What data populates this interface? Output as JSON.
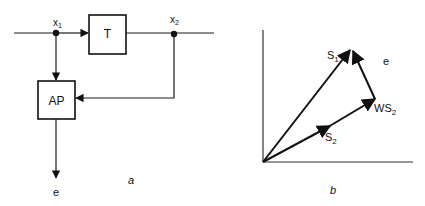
{
  "diagram_a": {
    "caption": "a",
    "blocks": {
      "t": {
        "label": "T"
      },
      "ap": {
        "label": "AP"
      }
    },
    "nodes": {
      "x1": {
        "label": "x",
        "sub": "1"
      },
      "x2": {
        "label": "x",
        "sub": "2"
      }
    },
    "output": {
      "label": "e"
    }
  },
  "diagram_b": {
    "caption": "b",
    "vectors": {
      "s1": {
        "label": "S",
        "sub": "1"
      },
      "s2": {
        "label": "S",
        "sub": "2"
      },
      "ws2": {
        "label": "WS",
        "sub": "2"
      },
      "e": {
        "label": "e"
      }
    }
  },
  "colors": {
    "ink": "#111111",
    "background": "#ffffff"
  }
}
